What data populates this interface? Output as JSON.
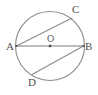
{
  "figure": {
    "type": "circle-geometry-diagram",
    "background_color": "#ffffff",
    "stroke_color": "#8a8a8a",
    "label_color": "#4f4f4f"
  },
  "circle": {
    "name": "circle",
    "center_x": 50,
    "center_y": 46,
    "radius": 34.5
  },
  "points": {
    "A": {
      "label": "A",
      "x": 16.5,
      "y": 46,
      "label_x": 6,
      "label_y": 50
    },
    "B": {
      "label": "B",
      "x": 83.5,
      "y": 46,
      "label_x": 85,
      "label_y": 50
    },
    "C": {
      "label": "C",
      "x": 72,
      "y": 18,
      "label_x": 72,
      "label_y": 13
    },
    "D": {
      "label": "D",
      "x": 32,
      "y": 74.5,
      "label_x": 28,
      "label_y": 86
    },
    "O": {
      "label": "O",
      "x": 50,
      "y": 46,
      "label_x": 47,
      "label_y": 42
    }
  },
  "segments": [
    {
      "name": "diameter-AB",
      "from": "A",
      "to": "B",
      "label": "AB"
    },
    {
      "name": "chord-AC",
      "from": "A",
      "to": "C",
      "label": "AC"
    },
    {
      "name": "chord-BD",
      "from": "B",
      "to": "D",
      "label": "BD"
    }
  ]
}
